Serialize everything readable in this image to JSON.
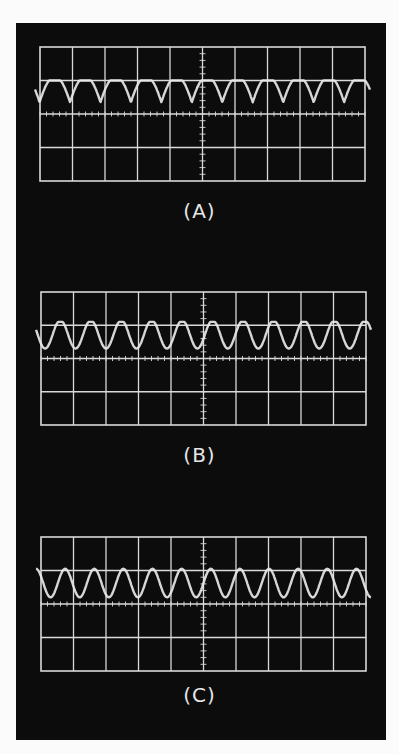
{
  "figure": {
    "panels": [
      {
        "label": "(A)",
        "description": "Periodic waveform with sharp downward dips"
      },
      {
        "label": "(B)",
        "description": "Periodic waveform with rounded deeper dips"
      },
      {
        "label": "(C)",
        "description": "Near-sinusoidal periodic waveform"
      }
    ]
  },
  "chart_data": [
    {
      "type": "line",
      "title": "(A)",
      "xlabel": "",
      "ylabel": "",
      "grid": true,
      "x_divisions": 10,
      "y_divisions": 4,
      "xlim": [
        0,
        10
      ],
      "ylim": [
        -2,
        2
      ],
      "series": [
        {
          "name": "trace-a",
          "shape": "sharp-dip",
          "cycles": 11,
          "baseline": 1.0,
          "trough": 0.35,
          "phase": 0.35
        }
      ]
    },
    {
      "type": "line",
      "title": "(B)",
      "xlabel": "",
      "ylabel": "",
      "grid": true,
      "x_divisions": 10,
      "y_divisions": 4,
      "xlim": [
        0,
        10
      ],
      "ylim": [
        -2,
        2
      ],
      "series": [
        {
          "name": "trace-b",
          "shape": "rounded-dip",
          "cycles": 11,
          "baseline": 1.1,
          "trough": 0.3,
          "phase": 0.2
        }
      ]
    },
    {
      "type": "line",
      "title": "(C)",
      "xlabel": "",
      "ylabel": "",
      "grid": true,
      "x_divisions": 10,
      "y_divisions": 4,
      "xlim": [
        0,
        10
      ],
      "ylim": [
        -2,
        2
      ],
      "series": [
        {
          "name": "trace-c",
          "shape": "sine",
          "cycles": 11.5,
          "baseline": 1.05,
          "trough": 0.2,
          "phase": 0.0
        }
      ]
    }
  ],
  "colors": {
    "background": "#0c0c0c",
    "grid": "#d9d9d9",
    "trace": "#e8e8e8",
    "page": "#fbfbfb"
  }
}
